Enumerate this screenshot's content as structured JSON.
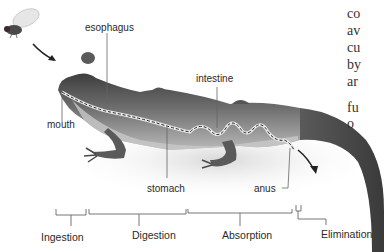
{
  "diagram": {
    "prey": "fly",
    "organ_labels": {
      "esophagus": "esophagus",
      "mouth": "mouth",
      "intestine": "intestine",
      "stomach": "stomach",
      "anus": "anus"
    },
    "stages": [
      "Ingestion",
      "Digestion",
      "Absorption",
      "Elimination"
    ],
    "side_text_fragments": [
      "co",
      "av",
      "cu",
      "by",
      "ar",
      "fu",
      "o"
    ],
    "colors": {
      "body_dark": "#4a4a4a",
      "body_mid": "#8a8a8a",
      "belly_light": "#c8c8c8",
      "tract_dash": "#222222",
      "label_text": "#2a2a2a",
      "leader_line": "#666666"
    }
  }
}
